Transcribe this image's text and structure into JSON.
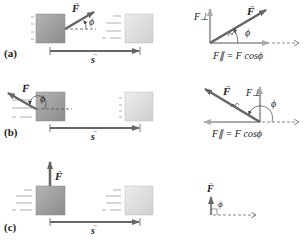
{
  "panels": [
    {
      "id": "a",
      "label": "(a)",
      "force_label": "F",
      "angle_label": "ϕ",
      "displacement_label": "s",
      "components": {
        "perp_label": "F⊥",
        "parallel_label": "F∥ = F cosϕ"
      }
    },
    {
      "id": "b",
      "label": "(b)",
      "force_label": "F",
      "angle_label": "ϕ",
      "displacement_label": "s",
      "components": {
        "perp_label": "F⊥",
        "parallel_label": "F∥ = F cosϕ"
      }
    },
    {
      "id": "c",
      "label": "(c)",
      "force_label": "F",
      "angle_label": "ϕ",
      "displacement_label": "s"
    }
  ],
  "colors": {
    "block_dark": "#9a9a9a",
    "block_light": "#dedede",
    "arrow_dark": "#666666",
    "arrow_component": "#aaaaaa",
    "text": "#222222"
  }
}
